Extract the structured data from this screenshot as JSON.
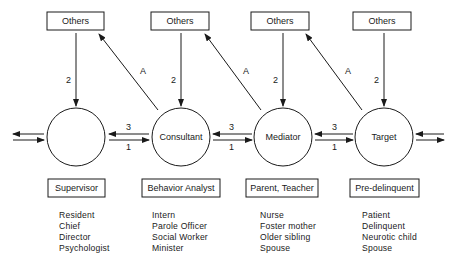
{
  "others_label": "Others",
  "edge_labels": {
    "down": "2",
    "up": "A",
    "left": "3",
    "right": "1"
  },
  "nodes": [
    {
      "circle_label": "",
      "role_label": "Supervisor",
      "examples": [
        "Resident",
        "Chief",
        "Director",
        "Psychologist"
      ]
    },
    {
      "circle_label": "Consultant",
      "role_label": "Behavior Analyst",
      "examples": [
        "Intern",
        "Parole Officer",
        "Social Worker",
        "Minister"
      ]
    },
    {
      "circle_label": "Mediator",
      "role_label": "Parent, Teacher",
      "examples": [
        "Nurse",
        "Foster mother",
        "Older sibling",
        "Spouse"
      ]
    },
    {
      "circle_label": "Target",
      "role_label": "Pre-delinquent",
      "examples": [
        "Patient",
        "Delinquent",
        "Neurotic child",
        "Spouse"
      ]
    }
  ]
}
